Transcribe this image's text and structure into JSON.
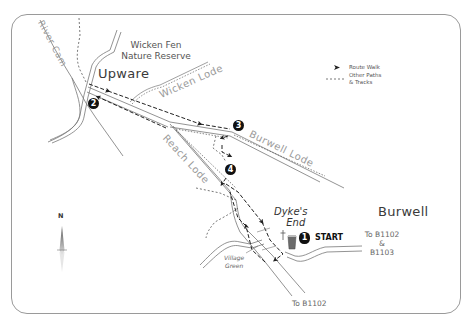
{
  "map": {
    "places": {
      "upware": "Upware",
      "wicken_fen": "Wicken Fen",
      "nature_reserve": "Nature Reserve",
      "burwell": "Burwell",
      "dykes_end_1": "Dyke's",
      "dykes_end_2": "End",
      "village_green_1": "Village",
      "village_green_2": "Green"
    },
    "waterways": {
      "river_cam": "River Cam",
      "wicken_lode": "Wicken Lode",
      "burwell_lode": "Burwell Lode",
      "reach_lode": "Reach Lode"
    },
    "roads": {
      "to_b1102_b1103_1": "To B1102",
      "to_b1102_b1103_2": "&",
      "to_b1102_b1103_3": "B1103",
      "to_b1102_south": "To B1102"
    },
    "markers": [
      {
        "id": "1",
        "label": "1"
      },
      {
        "id": "2",
        "label": "2"
      },
      {
        "id": "3",
        "label": "3"
      },
      {
        "id": "4",
        "label": "4"
      }
    ],
    "start_label": "START",
    "compass": {
      "label": "N"
    },
    "legend": {
      "route_walk": "Route Walk",
      "other_paths_1": "Other Paths",
      "other_paths_2": "& Tracks"
    },
    "colors": {
      "route": "#222222",
      "paths": "#555555",
      "water": "#8a8a8a",
      "frame": "#9a9a9a",
      "pub": "#6b6b6b"
    }
  }
}
